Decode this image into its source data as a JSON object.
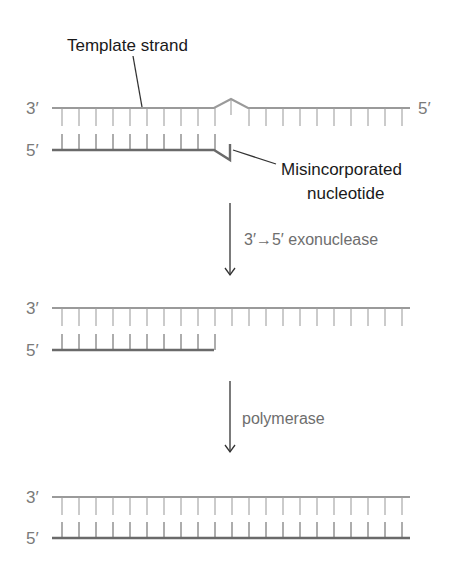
{
  "colors": {
    "template_strand": "#9a9a9a",
    "new_strand": "#6a6a6a",
    "tick_top": "#a0a0a0",
    "tick_bottom": "#6a6a6a",
    "arrow": "#333333",
    "leader": "#333333"
  },
  "callouts": {
    "template_strand": "Template strand",
    "misincorporated_line1": "Misincorporated",
    "misincorporated_line2": "nucleotide"
  },
  "steps": [
    {
      "label": "3′→5′ exonuclease"
    },
    {
      "label": "polymerase"
    }
  ],
  "panels": [
    {
      "name": "mismatch",
      "top_label": "3′",
      "top_end_label": "5′",
      "bottom_label": "5′",
      "top_y": 108,
      "bottom_y": 150,
      "bottom_ticks": 10,
      "has_bulge": true
    },
    {
      "name": "after-excision",
      "top_label": "3′",
      "bottom_label": "5′",
      "top_y": 308,
      "bottom_y": 350,
      "bottom_ticks": 10,
      "has_bulge": false
    },
    {
      "name": "repaired",
      "top_label": "3′",
      "bottom_label": "5′",
      "top_y": 497,
      "bottom_y": 538,
      "bottom_ticks": 21,
      "has_bulge": false
    }
  ],
  "layout": {
    "strand_x_start": 52,
    "strand_x_end": 410,
    "tick_x_start": 62,
    "tick_spacing": 17,
    "tick_count": 21,
    "tick_length": 18
  }
}
